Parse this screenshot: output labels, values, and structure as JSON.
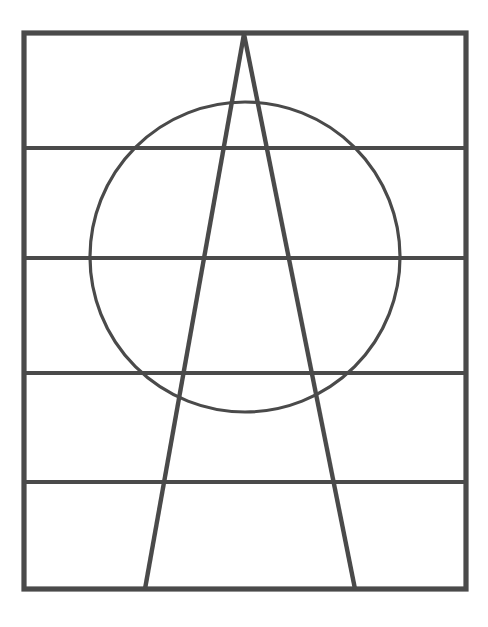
{
  "figure": {
    "title": "Geometric line drawing",
    "canvas": {
      "width": 488,
      "height": 627,
      "background": "#ffffff"
    },
    "stroke_color": "#4a4a4a",
    "shapes": {
      "frame": {
        "name": "outer-rectangle",
        "x": 24,
        "y": 33,
        "width": 442,
        "height": 556,
        "stroke_width": 5.2
      },
      "horizontal_dividers": {
        "name": "horizontal-divider-lines",
        "count": 4,
        "x_start": 24,
        "x_end": 466,
        "y_values": [
          148,
          258,
          373,
          482
        ],
        "stroke_width": 4.2
      },
      "circle": {
        "name": "inscribed-circle",
        "cx": 245,
        "cy": 257,
        "r": 155,
        "stroke_width": 3.2
      },
      "diagonals": [
        {
          "name": "diagonal-top-left-leg",
          "x1": 244,
          "y1": 34,
          "x2": 145,
          "y2": 589
        },
        {
          "name": "diagonal-top-right-leg",
          "x1": 244,
          "y1": 34,
          "x2": 355,
          "y2": 589
        }
      ],
      "crossing_point": {
        "name": "x-crossing",
        "x": 244,
        "y": 482
      },
      "apex_point": {
        "name": "triangle-apex",
        "x": 244,
        "y": 34
      }
    }
  },
  "chart_data": {
    "type": "scatter",
    "title": "Geometric line drawing",
    "xlabel": "",
    "ylabel": "",
    "xlim": [
      0,
      488
    ],
    "ylim": [
      0,
      627
    ],
    "grid": false,
    "legend": "none",
    "annotations": [
      "outer rectangle 442 x 556 px",
      "four horizontal dividers",
      "circle radius 155 px",
      "two diagonals crossing at (244, 482)"
    ]
  }
}
